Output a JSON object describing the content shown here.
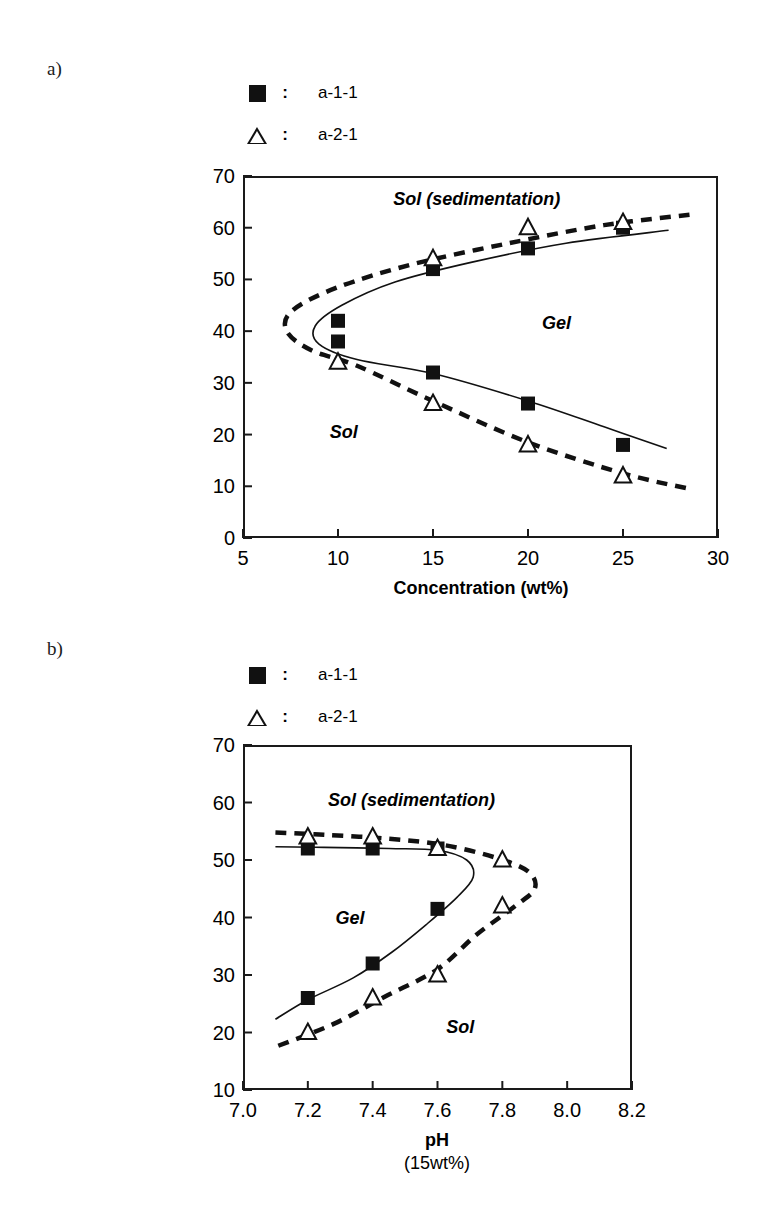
{
  "figure": {
    "panels": [
      {
        "label": "a)",
        "legend": [
          {
            "symbol": "filled-square",
            "separator": ":",
            "text": "a-1-1"
          },
          {
            "symbol": "open-triangle",
            "separator": ":",
            "text": "a-2-1"
          }
        ],
        "region_labels": [
          "Sol (sedimentation)",
          "Gel",
          "Sol"
        ]
      },
      {
        "label": "b)",
        "legend": [
          {
            "symbol": "filled-square",
            "separator": ":",
            "text": "a-1-1"
          },
          {
            "symbol": "open-triangle",
            "separator": ":",
            "text": "a-2-1"
          }
        ],
        "region_labels": [
          "Sol (sedimentation)",
          "Gel",
          "Sol"
        ]
      }
    ]
  },
  "chart_data": [
    {
      "type": "scatter",
      "panel": "a)",
      "title": "",
      "xlabel": "Concentration (wt%)",
      "ylabel": "",
      "xlim": [
        5,
        30
      ],
      "ylim": [
        0,
        70
      ],
      "xticks": [
        5,
        10,
        15,
        20,
        25,
        30
      ],
      "xticklabels": [
        "5",
        "10",
        "15",
        "20",
        "25",
        "30"
      ],
      "yticks": [
        0,
        10,
        20,
        30,
        40,
        50,
        60,
        70
      ],
      "yticklabels": [
        "0",
        "10",
        "20",
        "30",
        "40",
        "50",
        "60",
        "70"
      ],
      "grid": false,
      "legend_position": "above-plot",
      "annotations": [
        {
          "text": "Sol (sedimentation)",
          "x": 17.3,
          "y": 65.5,
          "style": "bold-italic"
        },
        {
          "text": "Gel",
          "x": 21.5,
          "y": 41.5,
          "style": "bold-italic"
        },
        {
          "text": "Sol",
          "x": 10.3,
          "y": 20.5,
          "style": "bold-italic"
        }
      ],
      "series": [
        {
          "name": "a-1-1",
          "marker": "filled-square",
          "points": [
            {
              "x": 10,
              "y": 42
            },
            {
              "x": 10,
              "y": 38
            },
            {
              "x": 15,
              "y": 52
            },
            {
              "x": 15,
              "y": 32
            },
            {
              "x": 20,
              "y": 56
            },
            {
              "x": 20,
              "y": 26
            },
            {
              "x": 25,
              "y": 60
            },
            {
              "x": 25,
              "y": 18
            }
          ],
          "boundary_curve": {
            "style": "solid",
            "points": [
              {
                "x": 27.4,
                "y": 59.5
              },
              {
                "x": 22.0,
                "y": 57.0
              },
              {
                "x": 17.0,
                "y": 53.3
              },
              {
                "x": 13.0,
                "y": 49.5
              },
              {
                "x": 10.2,
                "y": 45.0
              },
              {
                "x": 8.8,
                "y": 41.0
              },
              {
                "x": 9.0,
                "y": 37.5
              },
              {
                "x": 11.0,
                "y": 34.5
              },
              {
                "x": 15.0,
                "y": 31.8
              },
              {
                "x": 20.0,
                "y": 26.5
              },
              {
                "x": 24.0,
                "y": 21.5
              },
              {
                "x": 27.3,
                "y": 17.3
              }
            ]
          }
        },
        {
          "name": "a-2-1",
          "marker": "open-triangle",
          "points": [
            {
              "x": 10,
              "y": 34
            },
            {
              "x": 15,
              "y": 54
            },
            {
              "x": 15,
              "y": 26
            },
            {
              "x": 20,
              "y": 60
            },
            {
              "x": 20,
              "y": 18
            },
            {
              "x": 25,
              "y": 61
            },
            {
              "x": 25,
              "y": 12
            }
          ],
          "boundary_curve": {
            "style": "dashed",
            "points": [
              {
                "x": 28.5,
                "y": 62.5
              },
              {
                "x": 24.0,
                "y": 60.5
              },
              {
                "x": 19.0,
                "y": 57.0
              },
              {
                "x": 14.0,
                "y": 53.0
              },
              {
                "x": 10.0,
                "y": 48.5
              },
              {
                "x": 7.6,
                "y": 44.0
              },
              {
                "x": 7.3,
                "y": 40.0
              },
              {
                "x": 8.6,
                "y": 36.3
              },
              {
                "x": 11.0,
                "y": 33.3
              },
              {
                "x": 15.0,
                "y": 26.5
              },
              {
                "x": 20.0,
                "y": 18.5
              },
              {
                "x": 25.0,
                "y": 12.5
              },
              {
                "x": 28.5,
                "y": 9.5
              }
            ]
          }
        }
      ]
    },
    {
      "type": "scatter",
      "panel": "b)",
      "title": "",
      "xlabel": "pH",
      "xlabel_sub": "(15wt%)",
      "ylabel": "",
      "xlim": [
        7.0,
        8.2
      ],
      "ylim": [
        10,
        70
      ],
      "xticks": [
        7.0,
        7.2,
        7.4,
        7.6,
        7.8,
        8.0,
        8.2
      ],
      "xticklabels": [
        "7.0",
        "7.2",
        "7.4",
        "7.6",
        "7.8",
        "8.0",
        "8.2"
      ],
      "yticks": [
        10,
        20,
        30,
        40,
        50,
        60,
        70
      ],
      "yticklabels": [
        "10",
        "20",
        "30",
        "40",
        "50",
        "60",
        "70"
      ],
      "grid": false,
      "legend_position": "above-plot",
      "annotations": [
        {
          "text": "Sol (sedimentation)",
          "x": 7.52,
          "y": 60.5,
          "style": "bold-italic"
        },
        {
          "text": "Gel",
          "x": 7.33,
          "y": 40.0,
          "style": "bold-italic"
        },
        {
          "text": "Sol",
          "x": 7.67,
          "y": 21.0,
          "style": "bold-italic"
        }
      ],
      "series": [
        {
          "name": "a-1-1",
          "marker": "filled-square",
          "points": [
            {
              "x": 7.2,
              "y": 52
            },
            {
              "x": 7.2,
              "y": 26
            },
            {
              "x": 7.4,
              "y": 52
            },
            {
              "x": 7.4,
              "y": 32
            },
            {
              "x": 7.6,
              "y": 52
            },
            {
              "x": 7.6,
              "y": 41.5
            }
          ],
          "boundary_curve": {
            "style": "solid",
            "points": [
              {
                "x": 7.1,
                "y": 52.3
              },
              {
                "x": 7.25,
                "y": 52.2
              },
              {
                "x": 7.45,
                "y": 52.0
              },
              {
                "x": 7.6,
                "y": 51.7
              },
              {
                "x": 7.69,
                "y": 50.0
              },
              {
                "x": 7.71,
                "y": 47.0
              },
              {
                "x": 7.66,
                "y": 43.5
              },
              {
                "x": 7.57,
                "y": 39.0
              },
              {
                "x": 7.46,
                "y": 34.0
              },
              {
                "x": 7.34,
                "y": 29.5
              },
              {
                "x": 7.2,
                "y": 25.7
              },
              {
                "x": 7.1,
                "y": 22.3
              }
            ]
          }
        },
        {
          "name": "a-2-1",
          "marker": "open-triangle",
          "points": [
            {
              "x": 7.2,
              "y": 54
            },
            {
              "x": 7.2,
              "y": 20
            },
            {
              "x": 7.4,
              "y": 54
            },
            {
              "x": 7.4,
              "y": 26
            },
            {
              "x": 7.6,
              "y": 52
            },
            {
              "x": 7.6,
              "y": 30
            },
            {
              "x": 7.8,
              "y": 50
            },
            {
              "x": 7.8,
              "y": 42
            }
          ],
          "boundary_curve": {
            "style": "dashed",
            "points": [
              {
                "x": 7.1,
                "y": 54.8
              },
              {
                "x": 7.25,
                "y": 54.4
              },
              {
                "x": 7.45,
                "y": 53.7
              },
              {
                "x": 7.62,
                "y": 52.6
              },
              {
                "x": 7.78,
                "y": 50.4
              },
              {
                "x": 7.88,
                "y": 48.0
              },
              {
                "x": 7.9,
                "y": 45.0
              },
              {
                "x": 7.84,
                "y": 42.0
              },
              {
                "x": 7.72,
                "y": 37.0
              },
              {
                "x": 7.6,
                "y": 31.0
              },
              {
                "x": 7.44,
                "y": 26.3
              },
              {
                "x": 7.28,
                "y": 21.5
              },
              {
                "x": 7.1,
                "y": 17.5
              }
            ]
          }
        }
      ]
    }
  ]
}
